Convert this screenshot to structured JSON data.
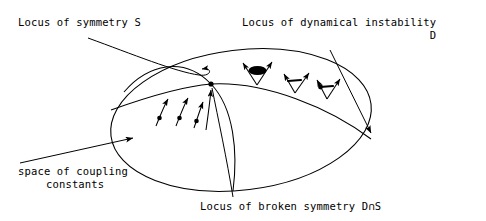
{
  "figure": {
    "width": 486,
    "height": 221,
    "background": "#ffffff",
    "stroke": "#000000",
    "caption_font": "monospace typewriter"
  },
  "labels": {
    "symmetry": {
      "text": "Locus of symmetry S",
      "name": "locus-of-symmetry-label"
    },
    "instability": {
      "line1": "Locus of dynamical instability",
      "line2": "D",
      "name": "locus-of-dynamical-instability-label"
    },
    "coupling": {
      "line1": "space of coupling",
      "line2": "constants",
      "name": "space-of-coupling-constants-label"
    },
    "broken": {
      "text": "Locus of broken symmetry D∩S",
      "name": "locus-of-broken-symmetry-label"
    }
  },
  "geometry": {
    "ellipse": {
      "cx": 241,
      "cy": 120,
      "rx": 131,
      "ry": 70,
      "rotation_deg": -7,
      "name": "coupling-constant-space-ellipse"
    },
    "junction_point": {
      "x": 211,
      "y": 84
    },
    "curve_s": {
      "description": "Locus of symmetry S, arc across the surface",
      "path": "M 122 88 C 150 62 185 58 211 84 C 233 107 237 150 233 190"
    },
    "curve_d": {
      "description": "Locus of dynamical instability D, sweeping curve",
      "path": "M 111 110 C 150 96 185 86 211 84 C 265 81 330 108 371 139"
    }
  },
  "markers": {
    "stable_arrows": {
      "count": 3,
      "description": "single arrows with base dot flowing up toward D",
      "items": [
        {
          "x1": 158,
          "y1": 124,
          "x2": 168,
          "y2": 98,
          "dot": {
            "x": 160,
            "y": 117
          }
        },
        {
          "x1": 178,
          "y1": 124,
          "x2": 187,
          "y2": 97,
          "dot": {
            "x": 180,
            "y": 117
          }
        },
        {
          "x1": 196,
          "y1": 126,
          "x2": 203,
          "y2": 100,
          "dot": {
            "x": 198,
            "y": 119
          }
        }
      ]
    },
    "pointer_arrow_to_junction": {
      "x1": 206,
      "y1": 128,
      "x2": 211,
      "y2": 88
    },
    "unstable_markers": {
      "count": 3,
      "description": "diverging V-shaped arrow pairs above the D curve with a dot at the vertex",
      "items": [
        {
          "vx": 257,
          "vy": 84,
          "blob": true
        },
        {
          "vx": 295,
          "vy": 92,
          "blob": false
        },
        {
          "vx": 327,
          "vy": 98,
          "blob": false
        }
      ]
    }
  },
  "leaders": {
    "symmetry": {
      "description": "curved leader from symmetry label hooking right onto S curve",
      "path": "M 88 38 C 130 52 175 70 200 74 C 212 76 212 68 203 69",
      "arrow_at": {
        "x": 204,
        "y": 69
      }
    },
    "instability": {
      "description": "straight leader from D label down to right side of ellipse",
      "path": "M 330 52 L 371 133",
      "arrow_at": {
        "x": 371,
        "y": 137
      }
    },
    "coupling": {
      "description": "straight leader from coupling label up-right to ellipse edge",
      "path": "M 22 162 L 135 137",
      "arrow_at": {
        "x": 138,
        "y": 136
      }
    },
    "broken": {
      "description": "near-vertical leader from bottom label up to junction dot",
      "path": "M 232 196 C 226 160 218 120 212 88"
    }
  }
}
